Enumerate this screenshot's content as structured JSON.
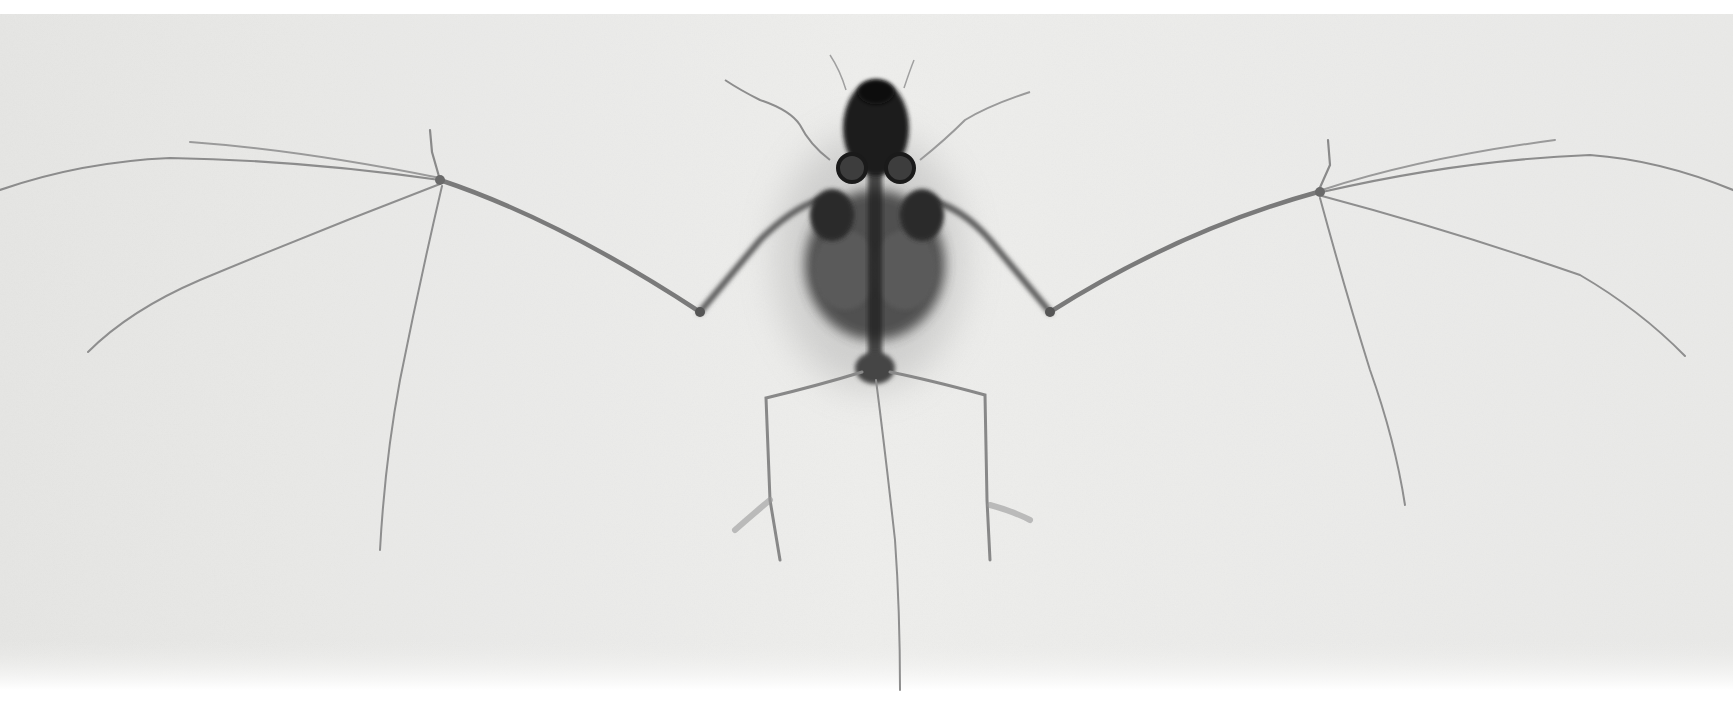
{
  "image": {
    "subject": "X-ray of a bat skeleton with wings outstretched",
    "alt": "Radiograph of a bat skeleton, wings spread, on a light gray background",
    "palette": {
      "background": "#ececea",
      "margin": "#ffffff",
      "bone_light": "#8f8f8f",
      "bone_mid": "#6a6a6a",
      "bone_dark": "#2a2a2a",
      "body_dark": "#1c1c1c"
    },
    "regions": {
      "film_area": {
        "x": 0,
        "y": 14,
        "width": 1733,
        "height": 676
      },
      "top_margin_height": 14,
      "bottom_margin_start": 690
    }
  }
}
